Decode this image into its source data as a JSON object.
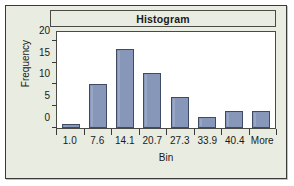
{
  "chart_data": {
    "type": "bar",
    "title": "Histogram",
    "xlabel": "Bin",
    "ylabel": "Frequency",
    "categories": [
      "1.0",
      "7.6",
      "14.1",
      "20.7",
      "27.3",
      "33.9",
      "40.4",
      "More"
    ],
    "values": [
      1,
      10,
      18,
      12.5,
      7,
      2.5,
      4,
      4
    ],
    "ylim": [
      0,
      22
    ],
    "yticks": [
      "0",
      "5",
      "10",
      "15",
      "20"
    ],
    "ytick_values": [
      0,
      5,
      10,
      15,
      20
    ],
    "grid": false,
    "legend": false,
    "bar_fill_color": "#8797b9",
    "bar_border_color": "#3f4a63",
    "plot_background": "#ffffff",
    "frame_background": "#e9ece0",
    "frame_border_color": "#3a3a38"
  }
}
